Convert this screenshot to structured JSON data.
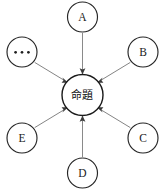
{
  "diagram": {
    "type": "radial-convergence",
    "canvas": {
      "width": 165,
      "height": 190,
      "background": "#ffffff"
    },
    "center": {
      "id": "center",
      "label": "命題",
      "meaning": "proposition",
      "cx": 82.5,
      "cy": 95,
      "r": 20.5,
      "stroke_color": "#1a1a1a",
      "fill_color": "#ffffff"
    },
    "nodes": [
      {
        "id": "node-a",
        "label": "A",
        "cx": 82.5,
        "cy": 17,
        "r": 15,
        "position": "top",
        "angle_deg": 90
      },
      {
        "id": "node-b",
        "label": "B",
        "cx": 143,
        "cy": 52,
        "r": 15,
        "position": "upper-right",
        "angle_deg": 30
      },
      {
        "id": "node-c",
        "label": "C",
        "cx": 143,
        "cy": 138,
        "r": 15,
        "position": "lower-right",
        "angle_deg": -30
      },
      {
        "id": "node-d",
        "label": "D",
        "cx": 82.5,
        "cy": 173,
        "r": 15,
        "position": "bottom",
        "angle_deg": -90
      },
      {
        "id": "node-e",
        "label": "E",
        "cx": 22,
        "cy": 138,
        "r": 15,
        "position": "lower-left",
        "angle_deg": -150
      },
      {
        "id": "node-ellipsis",
        "label": "⋯",
        "cx": 22,
        "cy": 52,
        "r": 15,
        "position": "upper-left",
        "angle_deg": 150
      }
    ],
    "edges": [
      {
        "id": "edge-a-center",
        "from": "node-a",
        "to": "center",
        "direction": "inward",
        "style": "arrow",
        "color": "#8a8a8a"
      },
      {
        "id": "edge-b-center",
        "from": "node-b",
        "to": "center",
        "direction": "inward",
        "style": "arrow",
        "color": "#6e6e6e"
      },
      {
        "id": "edge-c-center",
        "from": "node-c",
        "to": "center",
        "direction": "inward",
        "style": "arrow",
        "color": "#6e6e6e"
      },
      {
        "id": "edge-d-center",
        "from": "node-d",
        "to": "center",
        "direction": "inward",
        "style": "arrow",
        "color": "#8a8a8a"
      },
      {
        "id": "edge-e-center",
        "from": "node-e",
        "to": "center",
        "direction": "inward",
        "style": "arrow",
        "color": "#6e6e6e"
      },
      {
        "id": "edge-ellipsis-center",
        "from": "node-ellipsis",
        "to": "center",
        "direction": "inward",
        "style": "arrow",
        "color": "#6e6e6e"
      }
    ]
  }
}
